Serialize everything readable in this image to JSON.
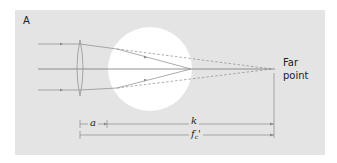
{
  "figure": {
    "panel_label": "A",
    "far_point_label_line1": "Far",
    "far_point_label_line2": "point",
    "dimensions": {
      "a_label": "a",
      "k_label": "k",
      "f_label": "f",
      "f_subscript": "c",
      "f_prime": "'"
    },
    "colors": {
      "background_panel": "#e4e4e4",
      "eye": "#ffffff",
      "lines": "#8a8a8a",
      "axis": "#777777",
      "text": "#222222"
    }
  }
}
